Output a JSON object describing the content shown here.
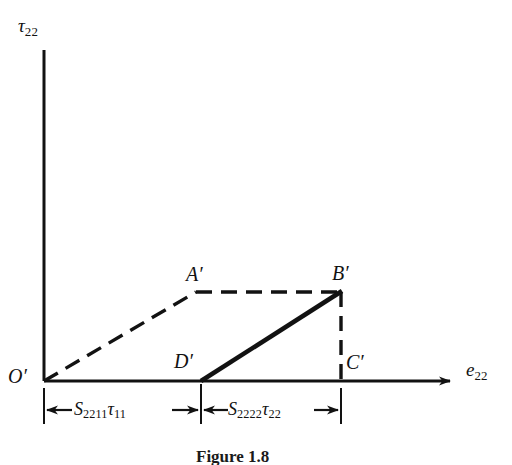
{
  "figure": {
    "caption": "Figure 1.8",
    "background_color": "#ffffff",
    "ink_color": "#121212"
  },
  "axes": {
    "y_label_symbol": "τ",
    "y_label_subscript": "22",
    "x_label_symbol": "e",
    "x_label_subscript": "22",
    "x_has_arrowhead": true,
    "y_has_arrowhead": false
  },
  "points": [
    {
      "id": "O",
      "label_symbol": "O",
      "label_prime": "′",
      "x": 44,
      "y": 381
    },
    {
      "id": "A",
      "label_symbol": "A",
      "label_prime": "′",
      "x": 196,
      "y": 292
    },
    {
      "id": "B",
      "label_symbol": "B",
      "label_prime": "′",
      "x": 341,
      "y": 292
    },
    {
      "id": "D",
      "label_symbol": "D",
      "label_prime": "′",
      "x": 201,
      "y": 381
    },
    {
      "id": "C",
      "label_symbol": "C",
      "label_prime": "′",
      "x": 341,
      "y": 381
    }
  ],
  "segments": [
    {
      "id": "OA",
      "from": "O",
      "to": "A",
      "style": "dashed",
      "width": 3
    },
    {
      "id": "AB",
      "from": "A",
      "to": "B",
      "style": "dashed",
      "width": 3
    },
    {
      "id": "DB",
      "from": "D",
      "to": "B",
      "style": "solid",
      "width": 4
    },
    {
      "id": "BC",
      "from": "B",
      "to": "C",
      "style": "dashed",
      "width": 3
    }
  ],
  "dimensions": [
    {
      "id": "dim-s2211",
      "symbol_s": "S",
      "sub_s": "2211",
      "symbol_tau": "τ",
      "sub_tau": "11",
      "from_x": 44,
      "to_x": 201,
      "y": 410
    },
    {
      "id": "dim-s2222",
      "symbol_s": "S",
      "sub_s": "2222",
      "symbol_tau": "τ",
      "sub_tau": "22",
      "from_x": 201,
      "to_x": 341,
      "y": 410
    }
  ]
}
